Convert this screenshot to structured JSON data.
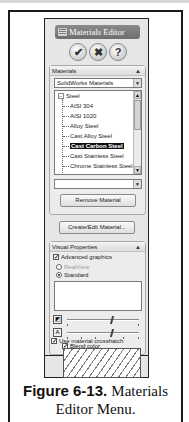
{
  "window": {
    "title": "Materials Editor",
    "actions": [
      {
        "name": "ok",
        "glyph": "✔"
      },
      {
        "name": "cancel",
        "glyph": "✖"
      },
      {
        "name": "help",
        "glyph": "?"
      }
    ]
  },
  "materials_group": {
    "header": "Materials",
    "collapse_glyph": "▲",
    "library_select": "SolidWorks Materials",
    "tree": {
      "root": {
        "expander": "−",
        "label": "Steel"
      },
      "items": [
        {
          "label": "AISI 304",
          "selected": false
        },
        {
          "label": "AISI 1020",
          "selected": false
        },
        {
          "label": "Alloy Steel",
          "selected": false
        },
        {
          "label": "Cast Alloy Steel",
          "selected": false
        },
        {
          "label": "Cast Carbon Steel",
          "selected": true
        },
        {
          "label": "Cast Stainless Steel",
          "selected": false
        },
        {
          "label": "Chrome Stainless Steel",
          "selected": false
        },
        {
          "label": "Galvanized Steel",
          "selected": false
        }
      ]
    },
    "secondary_select": "",
    "remove_button": "Remove Material",
    "create_edit_button": "Create/Edit Material..."
  },
  "visual_properties_group": {
    "header": "Visual Properties",
    "collapse_glyph": "▲",
    "advanced_graphics": {
      "label": "Advanced graphics",
      "checked": true
    },
    "realview": {
      "label": "RealView",
      "selected": false,
      "disabled": true
    },
    "standard": {
      "label": "Standard",
      "selected": true
    },
    "sliders": [
      {
        "name": "shininess",
        "value_pct": 62
      },
      {
        "name": "transparency",
        "value_pct": 62
      }
    ],
    "blend_color": {
      "label": "Blend color",
      "checked": true
    },
    "use_material_color": {
      "label": "Use material color",
      "checked": false
    },
    "use_material_crosshatch": {
      "label": "Use material crosshatch",
      "checked": true
    }
  },
  "caption": {
    "label": "Figure 6-13.",
    "text": "Materials Editor Menu."
  },
  "colors": {
    "title_bar": "#7a7a7a",
    "selection": "#111111",
    "panel_bg": "#e6e6e6"
  }
}
